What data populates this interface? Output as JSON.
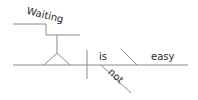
{
  "diagram": {
    "type": "sentence-diagram",
    "sentence": "Waiting is not easy",
    "words": {
      "subject": "Waiting",
      "verb": "is",
      "modifier": "not",
      "complement": "easy"
    },
    "colors": {
      "line": "#8a8a8a",
      "text": "#2a2a2a",
      "background": "#ffffff"
    }
  }
}
